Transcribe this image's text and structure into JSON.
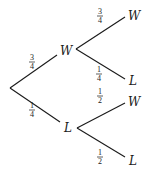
{
  "diagram": {
    "type": "probability-tree",
    "root": {
      "children": [
        {
          "label": "W",
          "probability": {
            "numerator": "3",
            "denominator": "4"
          },
          "children": [
            {
              "label": "W",
              "probability": {
                "numerator": "3",
                "denominator": "4"
              }
            },
            {
              "label": "L",
              "probability": {
                "numerator": "1",
                "denominator": "4"
              }
            }
          ]
        },
        {
          "label": "L",
          "probability": {
            "numerator": "1",
            "denominator": "4"
          },
          "children": [
            {
              "label": "W",
              "probability": {
                "numerator": "1",
                "denominator": "2"
              }
            },
            {
              "label": "L",
              "probability": {
                "numerator": "1",
                "denominator": "2"
              }
            }
          ]
        }
      ]
    }
  }
}
